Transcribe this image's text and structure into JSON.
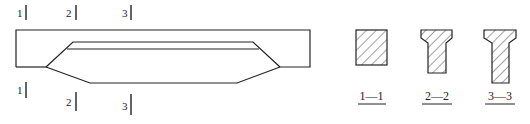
{
  "diagram": {
    "type": "beam elevation with cross-sections",
    "elevation": {
      "section_marks_top": [
        {
          "label": "1",
          "x": 26
        },
        {
          "label": "2",
          "x": 76
        },
        {
          "label": "3",
          "x": 131
        }
      ],
      "section_marks_bottom": [
        {
          "label": "1",
          "x": 26
        },
        {
          "label": "2",
          "x": 76
        },
        {
          "label": "3",
          "x": 131
        }
      ]
    },
    "sections": [
      {
        "id": "1-1",
        "caption": "1—1",
        "shape": "rectangle"
      },
      {
        "id": "2-2",
        "caption": "2—2",
        "shape": "T-section"
      },
      {
        "id": "3-3",
        "caption": "3—3",
        "shape": "T-section (deeper web)"
      }
    ],
    "colors": {
      "line": "#222222",
      "background": "#ffffff"
    }
  }
}
